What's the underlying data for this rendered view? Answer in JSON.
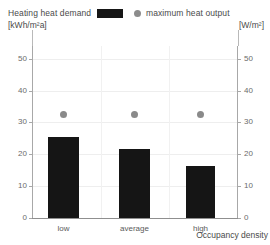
{
  "legend": {
    "left": {
      "label": "Heating heat demand",
      "units": "[kWh/m²a]",
      "swatch_name": "bar-swatch",
      "color": "#151515"
    },
    "right": {
      "label": "maximum heat output",
      "units": "[W/m²]",
      "marker_name": "dot-marker",
      "color": "#8a8a8a"
    }
  },
  "axes": {
    "x_title": "Occupancy density",
    "left_ticks": [
      "0",
      "10",
      "20",
      "30",
      "40",
      "50"
    ],
    "right_ticks": [
      "0",
      "10",
      "20",
      "30",
      "40",
      "50"
    ]
  },
  "chart_data": {
    "type": "bar",
    "title": "",
    "categories": [
      "low",
      "average",
      "high"
    ],
    "series": [
      {
        "name": "Heating heat demand",
        "unit": "kWh/m²a",
        "type": "bar",
        "axis": "left",
        "color": "#151515",
        "values": [
          26,
          22,
          16.5
        ]
      },
      {
        "name": "maximum heat output",
        "unit": "W/m²",
        "type": "scatter",
        "axis": "right",
        "color": "#8a8a8a",
        "values": [
          33,
          33,
          33
        ]
      }
    ],
    "xlabel": "Occupancy density",
    "ylabel": "[kWh/m²a]",
    "y2label": "[W/m²]",
    "ylim": [
      0,
      55
    ],
    "y2lim": [
      0,
      55
    ],
    "yticks": [
      0,
      10,
      20,
      30,
      40,
      50
    ],
    "grid": true,
    "legend_position": "top"
  }
}
